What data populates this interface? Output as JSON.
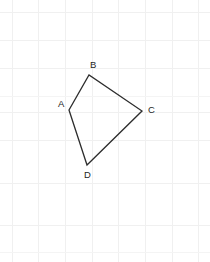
{
  "figure": {
    "name": "quadrilateral-abcd",
    "background_color": "#ffffff",
    "grid": {
      "visible": true,
      "color": "#f0f0f0",
      "spacing_px": 27,
      "vertical_lines_x": [
        12,
        38,
        65,
        92,
        118,
        145,
        172,
        198
      ],
      "horizontal_lines_y": [
        12,
        40,
        68,
        96,
        112,
        140,
        183,
        225,
        252
      ]
    },
    "stroke_color": "#2d2d2d",
    "stroke_width": 1.3,
    "label_color": "#242424",
    "vertices": [
      {
        "id": "A",
        "label": "A",
        "x": 69,
        "y": 110,
        "label_x": 58,
        "label_y": 99
      },
      {
        "id": "B",
        "label": "B",
        "x": 89,
        "y": 75,
        "label_x": 90,
        "label_y": 60
      },
      {
        "id": "C",
        "label": "C",
        "x": 142,
        "y": 111,
        "label_x": 148,
        "label_y": 105
      },
      {
        "id": "D",
        "label": "D",
        "x": 87,
        "y": 165,
        "label_x": 84,
        "label_y": 170
      }
    ],
    "edges": [
      {
        "id": "AB",
        "from": "A",
        "to": "B"
      },
      {
        "id": "BC",
        "from": "B",
        "to": "C"
      },
      {
        "id": "CD",
        "from": "C",
        "to": "D"
      },
      {
        "id": "DA",
        "from": "D",
        "to": "A"
      }
    ],
    "path_d": "M 69 110 L 89 75 L 142 111 L 87 165 Z"
  }
}
